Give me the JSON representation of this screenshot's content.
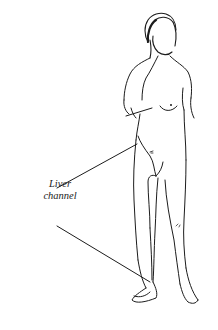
{
  "diagram": {
    "type": "anatomical-illustration",
    "label": {
      "line1": "Liver",
      "line2": "channel"
    },
    "leader_lines": [
      {
        "from": [
          55,
          190
        ],
        "to": [
          137,
          145
        ],
        "target": "liver channel on torso (lateral abdomen)"
      },
      {
        "from": [
          55,
          225
        ],
        "to": [
          150,
          285
        ],
        "target": "liver channel on lower leg (inner shin)"
      }
    ],
    "colors": {
      "background": "#ffffff",
      "ink": "#1c1c1c"
    }
  }
}
